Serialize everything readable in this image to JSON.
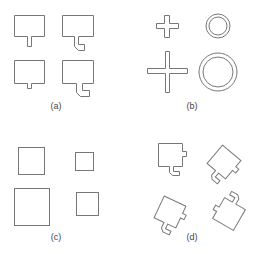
{
  "figure": {
    "panels": [
      {
        "id": "a",
        "label": "(a)",
        "description": "Rectangles with tab/hook protrusions at bottom"
      },
      {
        "id": "b",
        "label": "(b)",
        "description": "Plus-shaped crosses and concentric ring pairs at two scales"
      },
      {
        "id": "c",
        "label": "(c)",
        "description": "Squares of varying sizes"
      },
      {
        "id": "d",
        "label": "(d)",
        "description": "Rotated squares with side tab and bottom hook"
      }
    ],
    "stroke_color": "#777777",
    "background": "#ffffff"
  }
}
